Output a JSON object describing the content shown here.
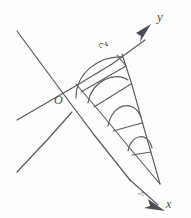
{
  "figure": {
    "kind": "hand-drawn-geometry-diagram",
    "background_color": "#fefefe",
    "ink_color": "#5b5b60",
    "width": 191,
    "height": 218,
    "labels": {
      "y_axis": "y",
      "x_axis": "x",
      "origin": "O",
      "segment_two": "2",
      "segment_four": "4"
    },
    "icons": {
      "y_arrow": "arrowhead-up-right-icon",
      "x_arrow": "arrowhead-down-right-icon"
    },
    "geometry": {
      "origin_point": [
        75,
        103
      ],
      "y_axis": {
        "from": [
          18,
          32
        ],
        "to": [
          148,
          27
        ],
        "arrow_at": "to",
        "description": "ray rising to upper right, labelled y"
      },
      "x_axis": {
        "from": [
          14,
          172
        ],
        "to": [
          176,
          209
        ],
        "arrow_at": "to",
        "description": "ray descending to lower right, labelled x"
      },
      "apex_point": [
        160,
        185
      ],
      "spiral_of_theodorus": {
        "description": "fan of right triangles with arc marks between the two rays",
        "triangle_count": 4,
        "arc_count": 4
      }
    }
  }
}
